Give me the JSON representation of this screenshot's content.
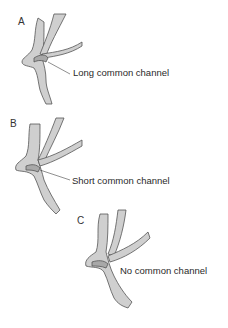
{
  "figure": {
    "panels": [
      {
        "letter": "A",
        "label": "Long common channel"
      },
      {
        "letter": "B",
        "label": "Short common channel"
      },
      {
        "letter": "C",
        "label": "No common channel"
      }
    ]
  },
  "colors": {
    "duct_fill": "#c8c8c8",
    "duct_outline": "#555555",
    "background": "#ffffff"
  }
}
